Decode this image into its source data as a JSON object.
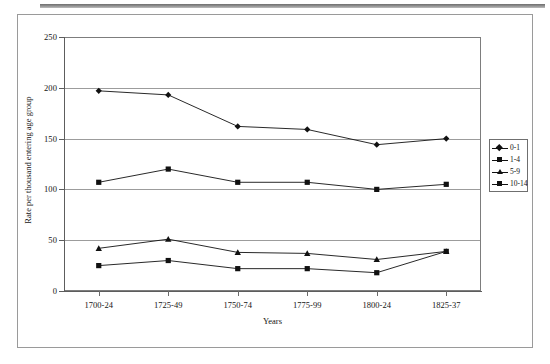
{
  "page": {
    "background_color": "#ffffff",
    "frame_color": "#9a9a9a"
  },
  "chart_data": {
    "type": "line",
    "title": "",
    "xlabel": "Years",
    "ylabel": "Rate per thousand entering age group",
    "categories": [
      "1700-24",
      "1725-49",
      "1750-74",
      "1775-99",
      "1800-24",
      "1825-37"
    ],
    "ylim": [
      0,
      250
    ],
    "yticks": [
      0,
      50,
      100,
      150,
      200,
      250
    ],
    "ytick_labels": [
      "0",
      "50",
      "100",
      "150",
      "200",
      "250"
    ],
    "grid": true,
    "grid_axis": "y",
    "legend_position": "right-outside",
    "series": [
      {
        "name": "0-1",
        "marker": "diamond",
        "color": "#111111",
        "values": [
          197,
          193,
          162,
          159,
          144,
          150
        ]
      },
      {
        "name": "1-4",
        "marker": "square",
        "color": "#111111",
        "values": [
          107,
          120,
          107,
          107,
          100,
          105
        ]
      },
      {
        "name": "5-9",
        "marker": "triangle",
        "color": "#111111",
        "values": [
          42,
          51,
          38,
          37,
          31,
          39
        ]
      },
      {
        "name": "10-14",
        "marker": "square",
        "color": "#111111",
        "values": [
          25,
          30,
          22,
          22,
          18,
          39
        ]
      }
    ]
  },
  "legend": {
    "items": [
      {
        "label": "0-1",
        "marker": "diamond"
      },
      {
        "label": "1-4",
        "marker": "square"
      },
      {
        "label": "5-9",
        "marker": "triangle"
      },
      {
        "label": "10-14",
        "marker": "square"
      }
    ]
  }
}
